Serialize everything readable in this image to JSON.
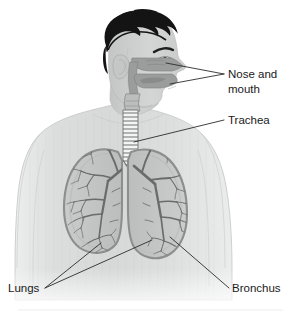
{
  "figure": {
    "background_color": "#ffffff"
  },
  "palette": {
    "background": "#ffffff",
    "hair": "#141414",
    "skin_body": "#d9dada",
    "skin_body_light": "#e6e7e7",
    "skin_face": "#cfd0d0",
    "airway_cavity": "#9b9c9c",
    "airway_cavity_dark": "#8a8b8b",
    "trachea_fill": "#f2f2f2",
    "trachea_ring": "#6f7070",
    "lung_fill": "#c6c7c7",
    "lung_outline": "#8d8e8e",
    "bronchial_tree": "#6a6b6b",
    "leader_line": "#2b2b2b",
    "label_text": "#1a1a1a",
    "footer_rule": "#e8e8e8"
  },
  "labels": [
    {
      "id": "nose-and-mouth",
      "line1": "Nose and",
      "line2": "mouth",
      "text_x": 228,
      "text_y": 78,
      "leaders": 2,
      "points_to": [
        "nasal cavity",
        "oral cavity"
      ]
    },
    {
      "id": "trachea",
      "line1": "Trachea",
      "line2": "",
      "text_x": 228,
      "text_y": 124,
      "leaders": 1,
      "points_to": [
        "trachea"
      ]
    },
    {
      "id": "lungs",
      "line1": "Lungs",
      "line2": "",
      "text_x": 8,
      "text_y": 292,
      "leaders": 2,
      "points_to": [
        "left lung",
        "right lung"
      ]
    },
    {
      "id": "bronchus",
      "line1": "Bronchus",
      "line2": "",
      "text_x": 232,
      "text_y": 292,
      "leaders": 1,
      "points_to": [
        "bronchus"
      ]
    }
  ],
  "structures": {
    "hair": "hair",
    "face": "face-profile",
    "ear": "ear",
    "eye": "eye",
    "eyebrow": "eyebrow",
    "torso": "torso",
    "neck": "neck",
    "nasal_cavity": "nasal-cavity",
    "oral_cavity": "oral-cavity",
    "pharynx": "pharynx",
    "larynx": "larynx",
    "trachea": "trachea",
    "trachea_rings": "trachea-cartilage-rings",
    "carina": "carina",
    "left_lung": "left-lung",
    "right_lung": "right-lung",
    "left_bronchial_tree": "left-bronchial-tree",
    "right_bronchial_tree": "right-bronchial-tree"
  }
}
